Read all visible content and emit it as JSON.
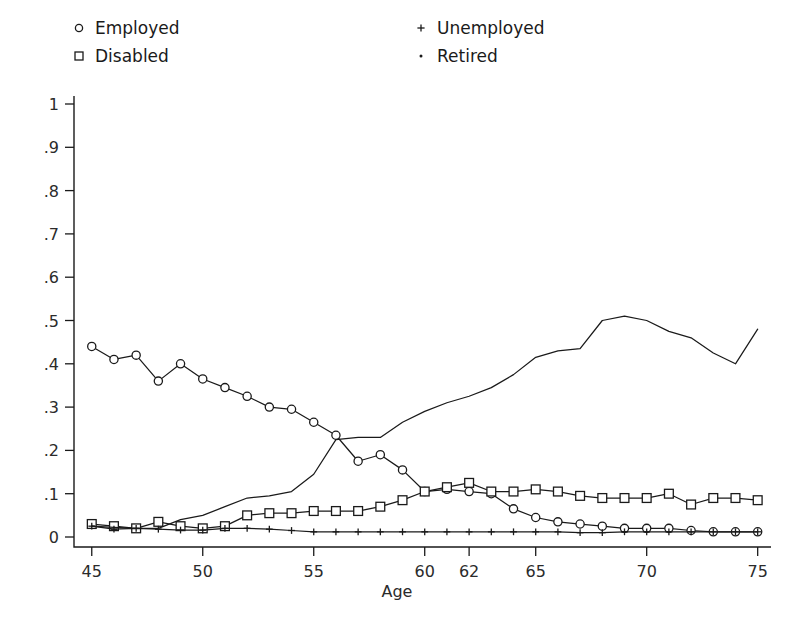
{
  "chart_data": {
    "type": "line",
    "title": "",
    "xlabel": "Age",
    "ylabel": "",
    "xlim": [
      44.2,
      75.6
    ],
    "ylim": [
      -0.02,
      1.04
    ],
    "grid": false,
    "legend_position": "above-plot",
    "x_ticks": [
      "45",
      "50",
      "55",
      "60",
      "62",
      "65",
      "70",
      "75"
    ],
    "x_tick_values": [
      45,
      50,
      55,
      60,
      62,
      65,
      70,
      75
    ],
    "y_ticks": [
      "0",
      ".1",
      ".2",
      ".3",
      ".4",
      ".5",
      ".6",
      ".7",
      ".8",
      ".9",
      "1"
    ],
    "y_tick_values": [
      0,
      0.1,
      0.2,
      0.3,
      0.4,
      0.5,
      0.6,
      0.7,
      0.8,
      0.9,
      1
    ],
    "x": [
      45,
      46,
      47,
      48,
      49,
      50,
      51,
      52,
      53,
      54,
      55,
      56,
      57,
      58,
      59,
      60,
      61,
      62,
      63,
      64,
      65,
      66,
      67,
      68,
      69,
      70,
      71,
      72,
      73,
      74,
      75
    ],
    "series": [
      {
        "name": "Employed",
        "marker": "circle",
        "values": [
          0.44,
          0.41,
          0.42,
          0.36,
          0.4,
          0.365,
          0.345,
          0.325,
          0.3,
          0.295,
          0.265,
          0.235,
          0.175,
          0.19,
          0.155,
          0.105,
          0.11,
          0.105,
          0.1,
          0.065,
          0.045,
          0.035,
          0.03,
          0.025,
          0.02,
          0.02,
          0.02,
          0.015,
          0.012,
          0.012,
          0.012
        ]
      },
      {
        "name": "Disabled",
        "marker": "square",
        "values": [
          0.03,
          0.025,
          0.02,
          0.035,
          0.025,
          0.02,
          0.025,
          0.05,
          0.055,
          0.055,
          0.06,
          0.06,
          0.06,
          0.07,
          0.085,
          0.105,
          0.115,
          0.125,
          0.105,
          0.105,
          0.11,
          0.105,
          0.095,
          0.09,
          0.09,
          0.09,
          0.1,
          0.075,
          0.09,
          0.09,
          0.085
        ]
      },
      {
        "name": "Unemployed",
        "marker": "plus",
        "values": [
          0.025,
          0.018,
          0.02,
          0.018,
          0.016,
          0.016,
          0.02,
          0.02,
          0.018,
          0.015,
          0.012,
          0.012,
          0.012,
          0.012,
          0.012,
          0.012,
          0.012,
          0.012,
          0.012,
          0.012,
          0.012,
          0.012,
          0.01,
          0.01,
          0.012,
          0.012,
          0.012,
          0.012,
          0.012,
          0.012,
          0.012
        ]
      },
      {
        "name": "Retired",
        "marker": "dot",
        "values": [
          0.025,
          0.022,
          0.02,
          0.02,
          0.04,
          0.05,
          0.07,
          0.09,
          0.095,
          0.105,
          0.145,
          0.225,
          0.23,
          0.23,
          0.265,
          0.29,
          0.31,
          0.325,
          0.345,
          0.375,
          0.415,
          0.43,
          0.435,
          0.5,
          0.51,
          0.5,
          0.475,
          0.46,
          0.425,
          0.4,
          0.48
        ]
      }
    ]
  },
  "legend": {
    "items": [
      {
        "label": "Employed",
        "marker": "circle"
      },
      {
        "label": "Disabled",
        "marker": "square"
      },
      {
        "label": "Unemployed",
        "marker": "plus"
      },
      {
        "label": "Retired",
        "marker": "dot"
      }
    ]
  },
  "colors": {
    "ink": "#1a1a1a",
    "background": "#ffffff",
    "tick_text": "#2b2b2b"
  }
}
